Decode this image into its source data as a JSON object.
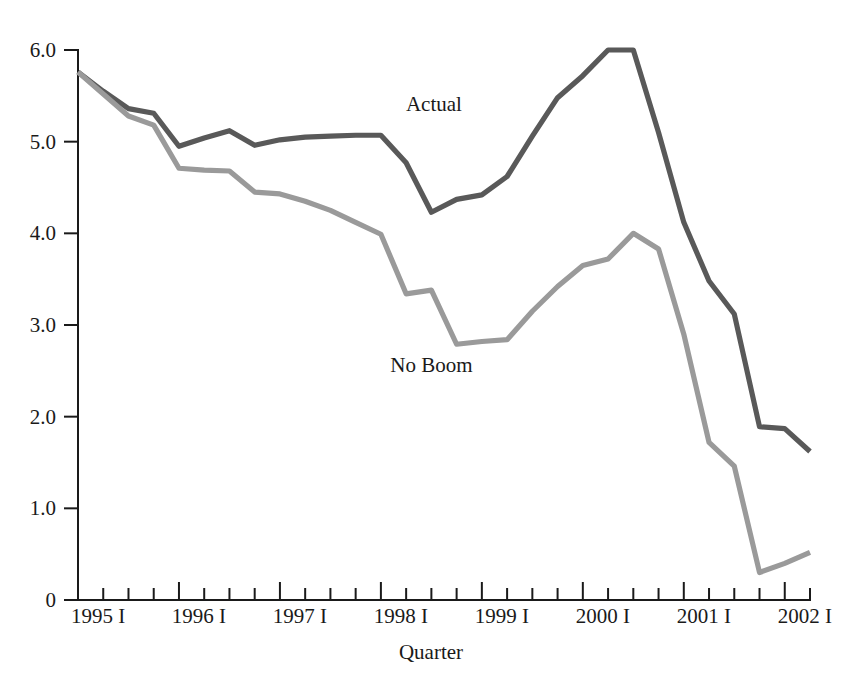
{
  "chart_data": {
    "type": "line",
    "title": "",
    "xlabel": "Quarter",
    "ylabel": "",
    "grid": false,
    "legend_position": "inline-annotation",
    "ylim": [
      0,
      6.0
    ],
    "y_ticks": [
      "0",
      "1.0",
      "2.0",
      "3.0",
      "4.0",
      "5.0",
      "6.0"
    ],
    "y_tick_values": [
      0,
      1.0,
      2.0,
      3.0,
      4.0,
      5.0,
      6.0
    ],
    "x_major_tick_labels": [
      "1995 I",
      "1996 I",
      "1997 I",
      "1998 I",
      "1999 I",
      "2000 I",
      "2001 I",
      "2002 I"
    ],
    "x_major_tick_indices": [
      0,
      4,
      8,
      12,
      16,
      20,
      24,
      28
    ],
    "x": [
      "1995 I",
      "1995 II",
      "1995 III",
      "1995 IV",
      "1996 I",
      "1996 II",
      "1996 III",
      "1996 IV",
      "1997 I",
      "1997 II",
      "1997 III",
      "1997 IV",
      "1998 I",
      "1998 II",
      "1998 III",
      "1998 IV",
      "1999 I",
      "1999 II",
      "1999 III",
      "1999 IV",
      "2000 I",
      "2000 II",
      "2000 III",
      "2000 IV",
      "2001 I",
      "2001 II",
      "2001 III",
      "2001 IV",
      "2002 I",
      "2002 II"
    ],
    "n_points": 30,
    "series": [
      {
        "name": "Actual",
        "color": "#595959",
        "label_x_index": 14.1,
        "label_y_value": 5.33,
        "values": [
          5.76,
          5.55,
          5.36,
          5.31,
          4.95,
          5.04,
          5.12,
          4.96,
          5.02,
          5.05,
          5.06,
          5.07,
          5.07,
          4.77,
          4.23,
          4.37,
          4.42,
          4.62,
          5.06,
          5.48,
          5.72,
          6.0,
          6.0,
          5.1,
          4.12,
          3.48,
          3.12,
          1.89,
          1.87,
          1.62
        ]
      },
      {
        "name": "No Boom",
        "color": "#9a9a9a",
        "label_x_index": 14.0,
        "label_y_value": 2.49,
        "values": [
          5.76,
          5.52,
          5.28,
          5.18,
          4.71,
          4.69,
          4.68,
          4.45,
          4.43,
          4.35,
          4.25,
          4.12,
          3.99,
          3.34,
          3.38,
          2.79,
          2.82,
          2.84,
          3.15,
          3.42,
          3.65,
          3.72,
          4.0,
          3.83,
          2.9,
          1.72,
          1.46,
          0.3,
          0.4,
          0.52
        ]
      }
    ]
  },
  "layout": {
    "plot_left": 78,
    "plot_right": 810,
    "plot_top": 50,
    "plot_bottom": 600,
    "x_title_y": 659
  }
}
